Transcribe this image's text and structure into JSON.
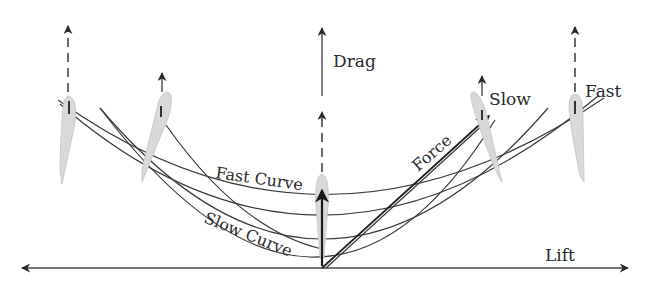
{
  "diagram": {
    "type": "force-diagram",
    "axes": {
      "horizontal": {
        "label": "Lift",
        "bidirectional": true
      },
      "vertical": {
        "label": "Drag"
      }
    },
    "labels": {
      "drag": "Drag",
      "lift": "Lift",
      "force": "Force",
      "slow": "Slow",
      "fast": "Fast",
      "fast_curve": "Fast Curve",
      "slow_curve": "Slow Curve"
    },
    "foils": [
      {
        "id": "far-left",
        "arrow_style": "dashed"
      },
      {
        "id": "left",
        "arrow_style": "solid-short"
      },
      {
        "id": "center",
        "arrow_style": "dashed"
      },
      {
        "id": "right-slow",
        "arrow_style": "solid-short",
        "label": "Slow"
      },
      {
        "id": "right-fast",
        "arrow_style": "dashed",
        "label": "Fast"
      }
    ],
    "curves": [
      {
        "name": "Fast Curve",
        "order": 1
      },
      {
        "name": "",
        "order": 2
      },
      {
        "name": "",
        "order": 3
      },
      {
        "name": "Slow Curve",
        "order": 4
      }
    ],
    "colors": {
      "line": "#3a3a3a",
      "foil_fill": "#d9d9d9",
      "background": "#ffffff"
    }
  }
}
